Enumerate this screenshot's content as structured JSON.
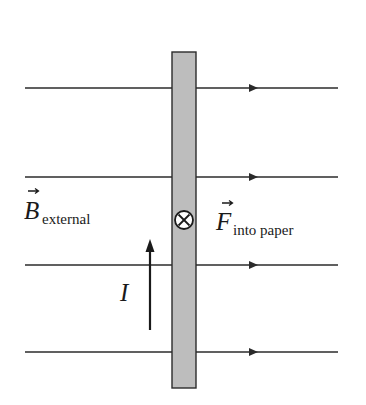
{
  "diagram": {
    "colors": {
      "line": "#2b2b2b",
      "wire_fill": "#bdbdbd",
      "wire_edge": "#2b2b2b",
      "background": "#ffffff"
    },
    "field_lines": [
      {
        "y": 88,
        "x1": 25,
        "x2": 338,
        "arrow_x": 253
      },
      {
        "y": 177,
        "x1": 25,
        "x2": 338,
        "arrow_x": 253
      },
      {
        "y": 265,
        "x1": 25,
        "x2": 338,
        "arrow_x": 253
      },
      {
        "y": 352,
        "x1": 25,
        "x2": 338,
        "arrow_x": 253
      }
    ],
    "wire": {
      "x": 172,
      "y": 52,
      "width": 24,
      "height": 336
    },
    "force_symbol": {
      "cx": 184,
      "cy": 220,
      "r": 9,
      "icon": "into-page-cross-icon"
    },
    "current_arrow": {
      "x": 150,
      "y_tail": 330,
      "y_head": 240
    },
    "labels": {
      "b_field": {
        "main": "B",
        "sub": "external",
        "vector": true
      },
      "force": {
        "main": "F",
        "sub": "into paper",
        "vector": true
      },
      "current": {
        "main": "I"
      }
    }
  }
}
